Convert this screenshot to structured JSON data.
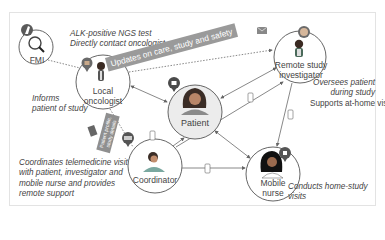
{
  "nodes": {
    "fmi": {
      "label": "FMI"
    },
    "local_oncologist": {
      "label_line1": "Local",
      "label_line2": "oncologist"
    },
    "patient": {
      "label": "Patient"
    },
    "remote_investigator": {
      "label_line1": "Remote study",
      "label_line2": "investigator"
    },
    "coordinator": {
      "label": "Coordinator"
    },
    "mobile_nurse": {
      "label_line1": "Mobile",
      "label_line2": "nurse"
    }
  },
  "notes": {
    "fmi": {
      "line1": "ALK-positive NGS test",
      "line2": "Directly contact oncologist"
    },
    "local_oncologist": {
      "line1": "Informs",
      "line2": "patient of study"
    },
    "remote_investigator": {
      "line1": "Oversees patient",
      "line2": "during study",
      "line3": "Supports at-home visits"
    },
    "coordinator": {
      "line1": "Coordinates telemedicine visit",
      "line2": "with patient, investigator and",
      "line3": "mobile nurse and provides",
      "line4": "remote support"
    },
    "mobile_nurse": {
      "line1": "Conducts home-study",
      "line2": "visits"
    }
  },
  "tags": {
    "updates": "Updates on care, study and safety",
    "patient_details": "Patient profile, study details"
  },
  "icons": [
    "microscope-icon",
    "magnifier-icon",
    "doctor-avatar",
    "patient-avatar",
    "investigator-avatar",
    "coordinator-avatar",
    "nurse-avatar",
    "envelope-icon",
    "phone-icon",
    "pin-icon"
  ],
  "colors": {
    "circle_stroke": "#555555",
    "patient_fill": "#ececec",
    "tag_bg": "#9a9a9a",
    "line": "#666666",
    "pin": "#5a5a5a"
  }
}
